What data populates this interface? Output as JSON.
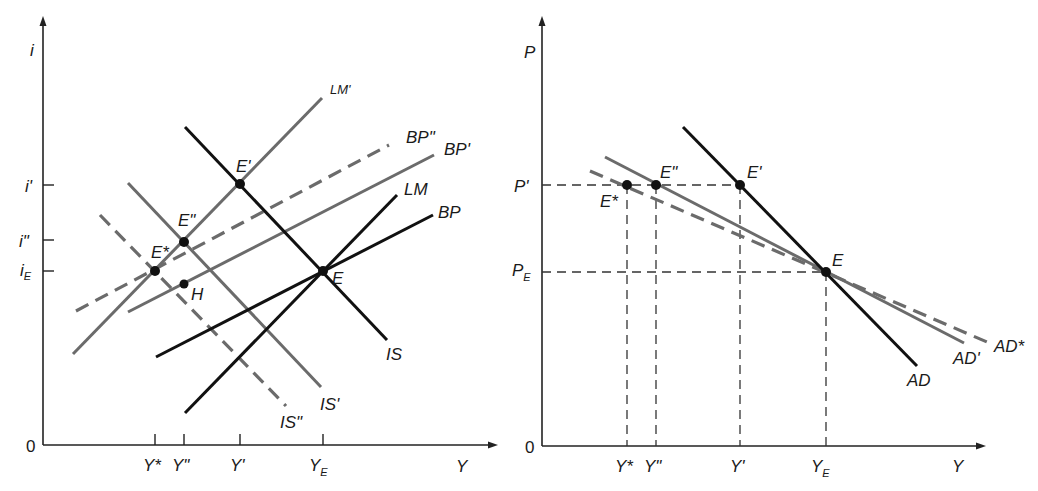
{
  "left_panel": {
    "y_axis_label": "i",
    "x_axis_label": "Y",
    "origin_label": "0",
    "y_ticks": [
      {
        "label": "i'",
        "y": 185
      },
      {
        "label": "i\"",
        "y": 240
      },
      {
        "label": "i",
        "sub": "E",
        "y": 271
      }
    ],
    "x_ticks": [
      {
        "label": "Y*",
        "x": 155
      },
      {
        "label": "Y\"",
        "x": 184
      },
      {
        "label": "Y'",
        "x": 240
      },
      {
        "label": "Y",
        "sub": "E",
        "x": 323
      }
    ],
    "curves": [
      {
        "name": "IS",
        "style": "black",
        "from": [
          185,
          127
        ],
        "to": [
          387,
          340
        ],
        "label": "IS"
      },
      {
        "name": "LM",
        "style": "black",
        "from": [
          185,
          413
        ],
        "to": [
          397,
          195
        ],
        "label": "LM"
      },
      {
        "name": "BP",
        "style": "black",
        "from": [
          156,
          357
        ],
        "to": [
          433,
          215
        ],
        "label": "BP"
      },
      {
        "name": "IS'",
        "style": "gray",
        "from": [
          128,
          183
        ],
        "to": [
          321,
          387
        ],
        "label": "IS'"
      },
      {
        "name": "LM'",
        "style": "gray",
        "from": [
          73,
          354
        ],
        "to": [
          322,
          98
        ],
        "label": "LM'"
      },
      {
        "name": "BP'",
        "style": "gray",
        "from": [
          128,
          312
        ],
        "to": [
          434,
          155
        ],
        "label": "BP'"
      },
      {
        "name": "IS\"",
        "style": "gray-dash",
        "from": [
          100,
          215
        ],
        "to": [
          286,
          406
        ],
        "label": "IS\""
      },
      {
        "name": "BP\"",
        "style": "gray-dash",
        "from": [
          76,
          311
        ],
        "to": [
          389,
          145
        ],
        "label": "BP\""
      }
    ],
    "points": [
      {
        "label": "E",
        "x": 323,
        "y": 271
      },
      {
        "label": "E'",
        "x": 240,
        "y": 184
      },
      {
        "label": "E\"",
        "x": 184,
        "y": 242
      },
      {
        "label": "E*",
        "x": 155,
        "y": 271
      },
      {
        "label": "H",
        "x": 184,
        "y": 284
      }
    ]
  },
  "right_panel": {
    "y_axis_label": "P",
    "x_axis_label": "Y",
    "origin_label": "0",
    "y_ticks": [
      {
        "label": "P'",
        "y": 185
      },
      {
        "label": "P",
        "sub": "E",
        "y": 272
      }
    ],
    "x_ticks": [
      {
        "label": "Y*",
        "x": 627
      },
      {
        "label": "Y\"",
        "x": 656
      },
      {
        "label": "Y'",
        "x": 740
      },
      {
        "label": "Y",
        "sub": "E",
        "x": 826
      }
    ],
    "curves": [
      {
        "name": "AD",
        "style": "black",
        "from": [
          683,
          127
        ],
        "to": [
          917,
          366
        ],
        "label": "AD"
      },
      {
        "name": "AD'",
        "style": "gray",
        "from": [
          605,
          157
        ],
        "to": [
          964,
          343
        ],
        "label": "AD'"
      },
      {
        "name": "AD*",
        "style": "gray-dash",
        "from": [
          590,
          171
        ],
        "to": [
          987,
          342
        ],
        "label": "AD*"
      }
    ],
    "points": [
      {
        "label": "E",
        "x": 826,
        "y": 272
      },
      {
        "label": "E'",
        "x": 740,
        "y": 185
      },
      {
        "label": "E\"",
        "x": 656,
        "y": 185
      },
      {
        "label": "E*",
        "x": 627,
        "y": 185
      }
    ]
  },
  "colors": {
    "black_curve": "#111111",
    "gray_curve": "#6b6b6b",
    "axis": "#222222",
    "background": "#ffffff"
  }
}
